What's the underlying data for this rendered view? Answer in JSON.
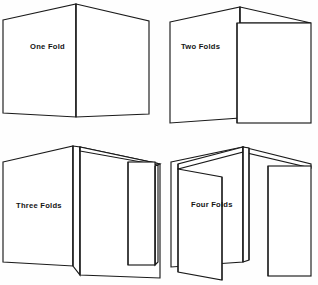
{
  "document": {
    "title": "Paper Folding Diagrams",
    "background_color": "#fefefe",
    "ink_color": "#1a1a1a"
  },
  "figures": [
    {
      "id": "one-fold",
      "label": "One Fold",
      "panel_count": 2,
      "label_x": 30,
      "label_y": 49
    },
    {
      "id": "two-folds",
      "label": "Two Folds",
      "panel_count": 3,
      "label_x": 181,
      "label_y": 49
    },
    {
      "id": "three-folds",
      "label": "Three Folds",
      "panel_count": 4,
      "label_x": 16,
      "label_y": 208
    },
    {
      "id": "four-folds",
      "label": "Four Folds",
      "panel_count": 5,
      "label_x": 191,
      "label_y": 207
    }
  ]
}
